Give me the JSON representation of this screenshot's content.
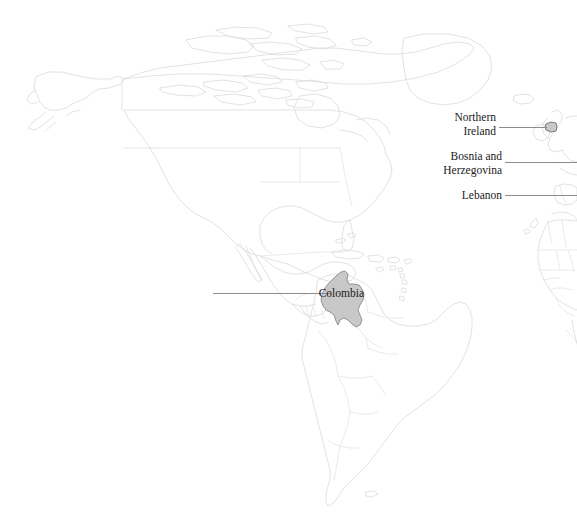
{
  "map": {
    "title": "World map with highlighted countries",
    "background_color": "#ffffff",
    "country_outline_color": "#dadada",
    "highlight_fill_color": "#c8c8c8",
    "highlight_outline_color": "#8a8a8a",
    "leader_line_color": "#8c8c8c",
    "label_text_color": "#1a1a1a",
    "projection_note": "Americas, Europe and West Africa visible"
  },
  "annotations": [
    {
      "id": "northern-ireland",
      "name": "Northern Ireland",
      "lines": [
        "Northern",
        "Ireland"
      ],
      "label_right": 496,
      "label_top": 111,
      "line_x": 499,
      "line_y": 127,
      "line_width": 48,
      "highlight_visible": true
    },
    {
      "id": "bosnia-and-herzegovina",
      "name": "Bosnia and Herzegovina",
      "lines": [
        "Bosnia and",
        "Herzegovina"
      ],
      "label_right": 502,
      "label_top": 150,
      "line_x": 505,
      "line_y": 162,
      "line_width": 72,
      "highlight_visible": false
    },
    {
      "id": "lebanon",
      "name": "Lebanon",
      "lines": [
        "Lebanon"
      ],
      "label_right": 502,
      "label_top": 189,
      "line_x": 505,
      "line_y": 195,
      "line_width": 72,
      "highlight_visible": false
    },
    {
      "id": "colombia",
      "name": "Colombia",
      "lines": [
        "Colombia"
      ],
      "label_right": 364,
      "label_top": 287,
      "line_x": 213,
      "line_y": 293,
      "line_width": 118,
      "highlight_visible": true
    }
  ]
}
